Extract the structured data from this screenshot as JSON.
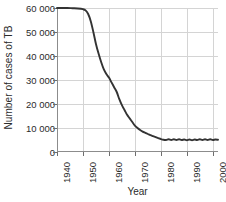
{
  "chart_data": {
    "type": "line",
    "title": "",
    "xlabel": "Year",
    "ylabel": "Number of cases of TB",
    "xlim": [
      1940,
      2002
    ],
    "ylim": [
      0,
      60000
    ],
    "grid": true,
    "legend": false,
    "legend_position": "none",
    "line_color": "#333333",
    "grid_color": "#d4d4d4",
    "axis_color": "#8c8c8c",
    "x_tick_labels": [
      "1940",
      "1950",
      "1960",
      "1970",
      "1980",
      "1990",
      "2000"
    ],
    "x_tick_values": [
      1940,
      1950,
      1960,
      1970,
      1980,
      1990,
      2000
    ],
    "y_tick_labels": [
      "0",
      "10 000",
      "20 000",
      "30 000",
      "40 000",
      "50 000",
      "60 000"
    ],
    "y_tick_values": [
      0,
      10000,
      20000,
      30000,
      40000,
      50000,
      60000
    ],
    "series": [
      {
        "name": "Number of cases of TB",
        "x": [
          1940,
          1942,
          1944,
          1946,
          1948,
          1950,
          1951,
          1952,
          1953,
          1954,
          1955,
          1956,
          1957,
          1958,
          1959,
          1960,
          1961,
          1962,
          1963,
          1964,
          1965,
          1966,
          1967,
          1968,
          1969,
          1970,
          1971,
          1972,
          1973,
          1974,
          1975,
          1976,
          1977,
          1978,
          1979,
          1980,
          1981,
          1982,
          1983,
          1984,
          1985,
          1986,
          1987,
          1988,
          1989,
          1990,
          1991,
          1992,
          1993,
          1994,
          1995,
          1996,
          1997,
          1998,
          1999,
          2000,
          2001,
          2002
        ],
        "values": [
          60000,
          60000,
          60000,
          59900,
          59800,
          59500,
          59000,
          57500,
          54500,
          50000,
          45000,
          41000,
          37500,
          34500,
          32500,
          31000,
          29000,
          27000,
          25000,
          22000,
          19500,
          17500,
          15500,
          14000,
          12500,
          11000,
          10000,
          9200,
          8500,
          8000,
          7500,
          7000,
          6600,
          6200,
          5800,
          5400,
          5100,
          5000,
          5300,
          5000,
          5300,
          5000,
          5300,
          5000,
          5200,
          4900,
          5200,
          4900,
          5200,
          5000,
          5300,
          5000,
          5300,
          5000,
          5300,
          5000,
          5200,
          5100
        ]
      }
    ]
  },
  "axes": {
    "y_title": "Number of cases of TB",
    "x_title": "Year"
  }
}
